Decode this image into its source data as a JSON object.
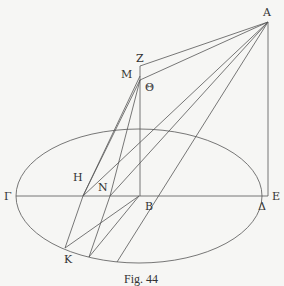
{
  "figure": {
    "caption": "Fig. 44",
    "labels": {
      "A": "A",
      "Z": "Z",
      "M": "M",
      "Theta": "Θ",
      "H": "H",
      "N": "N",
      "Gamma": "Γ",
      "B": "B",
      "E": "E",
      "Delta": "Δ",
      "K": "K"
    }
  }
}
